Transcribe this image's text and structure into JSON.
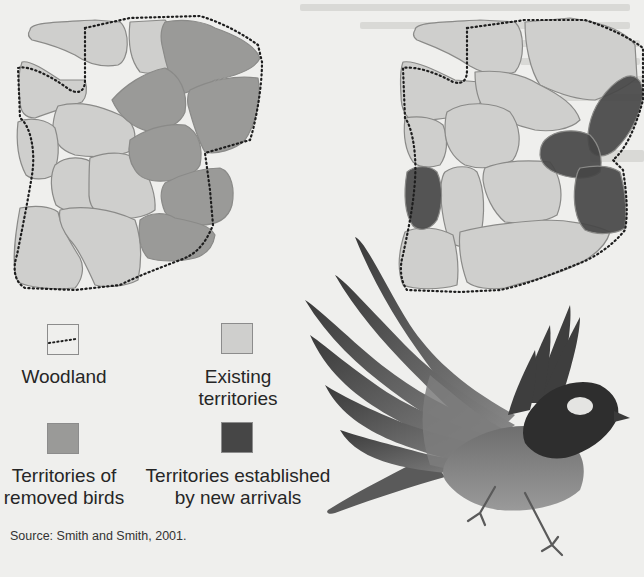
{
  "figure": {
    "title": "",
    "colors": {
      "background": "#efefed",
      "existing_territory": "#cfcfcd",
      "removed_territory": "#9a9a98",
      "new_arrival_territory": "#464646",
      "territory_outline": "#8a8a88",
      "woodland_border": "#1e1e1e"
    },
    "maps": [
      {
        "id": "before",
        "position": "left",
        "description": "Territory map before removal: existing territories (light) and territories of removed birds (medium grey) within woodland boundary (dotted)."
      },
      {
        "id": "after",
        "position": "right",
        "description": "Territory map after removal: existing territories (light) and territories established by new arrivals (dark grey) within woodland boundary (dotted)."
      }
    ],
    "legend": [
      {
        "key": "woodland",
        "swatch": "dotted-line",
        "lines": [
          "Woodland"
        ]
      },
      {
        "key": "existing",
        "swatch": "#cfcfcd",
        "lines": [
          "Existing",
          "territories"
        ]
      },
      {
        "key": "removed",
        "swatch": "#9a9a98",
        "lines": [
          "Territories of",
          "removed birds"
        ]
      },
      {
        "key": "new_arrivals",
        "swatch": "#464646",
        "lines": [
          "Territories established",
          "by new arrivals"
        ]
      }
    ],
    "source": "Source: Smith and Smith, 2001.",
    "illustration": {
      "subject": "bird-in-flight",
      "icon": "bird-icon"
    }
  }
}
